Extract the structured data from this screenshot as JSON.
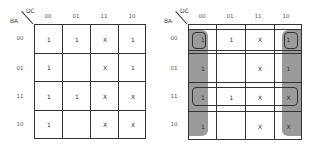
{
  "left_map": {
    "col_var": "DC",
    "row_var": "BA",
    "col_headers": [
      "00",
      "01",
      "11",
      "10"
    ],
    "row_headers": [
      "00",
      "01",
      "11",
      "10"
    ],
    "cells": [
      [
        "1",
        "1",
        "X",
        "1"
      ],
      [
        "1",
        "",
        "X",
        "1"
      ],
      [
        "1",
        "1",
        "X",
        "X"
      ],
      [
        "1",
        "",
        "X",
        "X"
      ]
    ]
  },
  "right_map": {
    "col_var": "DC",
    "row_var": "BA",
    "col_headers": [
      "00",
      "01",
      "11",
      "10"
    ],
    "row_headers": [
      "00",
      "01",
      "11",
      "10"
    ],
    "cells": [
      [
        "1",
        "1",
        "X",
        "1"
      ],
      [
        "1",
        "",
        "X",
        "1"
      ],
      [
        "1",
        "1",
        "X",
        "X"
      ],
      [
        "1",
        "",
        "X",
        "X"
      ]
    ],
    "groupings": [
      {
        "name": "column-00-group",
        "shaded": true
      },
      {
        "name": "column-10-group",
        "shaded": true
      },
      {
        "name": "row-00-group",
        "shaded": false
      },
      {
        "name": "row-11-group",
        "shaded": false
      },
      {
        "name": "corner-cell-00-00",
        "shaded": false
      },
      {
        "name": "corner-cell-00-10",
        "shaded": false
      }
    ],
    "shade_color": "#9a9a9a"
  }
}
